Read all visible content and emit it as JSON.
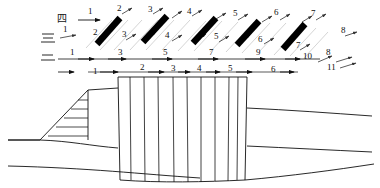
{
  "figure": {
    "title": "",
    "type": "geological-cross-section-with-stage-arrow-rows",
    "background_color": "#ffffff",
    "ink_color": "#111111",
    "guide_color": "#c9c9c9",
    "bar_color": "#000000",
    "width": 380,
    "height": 188
  },
  "rows": [
    {
      "id": "row-4",
      "cjk_label": "四",
      "label_x": 62,
      "label_y": 18,
      "baseline_y": 16,
      "kind": "diagonal-arrow-row",
      "labels": [
        {
          "text": "1",
          "x": 88,
          "y": 14
        },
        {
          "text": "2",
          "x": 117,
          "y": 11
        },
        {
          "text": "3",
          "x": 148,
          "y": 12
        },
        {
          "text": "4",
          "x": 187,
          "y": 14
        },
        {
          "text": "5",
          "x": 233,
          "y": 16
        },
        {
          "text": "6",
          "x": 274,
          "y": 15
        },
        {
          "text": "7",
          "x": 311,
          "y": 16
        }
      ]
    },
    {
      "id": "row-3",
      "cjk_label": "三",
      "label_x": 46,
      "label_y": 38,
      "baseline_y": 36,
      "kind": "diagonal-arrow-row",
      "labels": [
        {
          "text": "1",
          "x": 63,
          "y": 32
        },
        {
          "text": "2",
          "x": 93,
          "y": 35
        },
        {
          "text": "3",
          "x": 122,
          "y": 37
        },
        {
          "text": "4",
          "x": 165,
          "y": 38
        },
        {
          "text": "5",
          "x": 214,
          "y": 39
        },
        {
          "text": "6",
          "x": 258,
          "y": 42
        },
        {
          "text": "7",
          "x": 296,
          "y": 48
        },
        {
          "text": "8",
          "x": 341,
          "y": 33
        }
      ]
    },
    {
      "id": "row-2",
      "cjk_label": "二",
      "label_x": 46,
      "label_y": 58,
      "baseline_y": 58,
      "kind": "horizontal-arrow-row",
      "labels": [
        {
          "text": "1",
          "x": 70,
          "y": 55
        },
        {
          "text": "3",
          "x": 118,
          "y": 55
        },
        {
          "text": "5",
          "x": 163,
          "y": 55
        },
        {
          "text": "7",
          "x": 209,
          "y": 55
        },
        {
          "text": "9",
          "x": 256,
          "y": 55
        },
        {
          "text": "10",
          "x": 305,
          "y": 57
        },
        {
          "text": "8",
          "x": 327,
          "y": 53
        },
        {
          "text": "11",
          "x": 329,
          "y": 68
        }
      ]
    },
    {
      "id": "row-1",
      "cjk_label": "一",
      "label_x": 60,
      "label_y": 70,
      "baseline_y": 70,
      "kind": "horizontal-arrow-row",
      "labels": [
        {
          "text": "1",
          "x": 96,
          "y": 70
        },
        {
          "text": "2",
          "x": 143,
          "y": 68
        },
        {
          "text": "3",
          "x": 174,
          "y": 69
        },
        {
          "text": "4",
          "x": 200,
          "y": 69
        },
        {
          "text": "5",
          "x": 231,
          "y": 69
        },
        {
          "text": "6",
          "x": 274,
          "y": 70
        }
      ]
    }
  ],
  "black_bars": [
    {
      "id": "bar-1",
      "x1": 97,
      "y1": 44,
      "x2": 120,
      "y2": 18
    },
    {
      "id": "bar-2",
      "x1": 143,
      "y1": 42,
      "x2": 167,
      "y2": 16
    },
    {
      "id": "bar-3",
      "x1": 193,
      "y1": 43,
      "x2": 216,
      "y2": 18
    },
    {
      "id": "bar-4",
      "x1": 237,
      "y1": 45,
      "x2": 259,
      "y2": 21
    },
    {
      "id": "bar-5",
      "x1": 283,
      "y1": 49,
      "x2": 305,
      "y2": 24
    }
  ],
  "structure": {
    "central_block": {
      "name": "central-striated-block",
      "left": 118,
      "right": 247,
      "top": 77,
      "bottom": 180,
      "vertical_line_count": 9
    },
    "embankment": {
      "name": "left-embankment-with-hatching",
      "hatch_line_count": 5
    },
    "strata_line_count": 6
  }
}
